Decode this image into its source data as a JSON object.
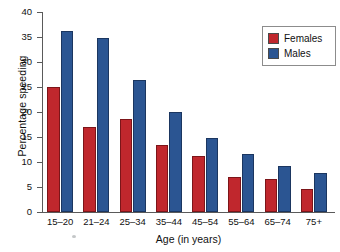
{
  "chart_data": {
    "type": "bar",
    "title": "",
    "xlabel": "Age (in years)",
    "ylabel": "Percentage speeding",
    "categories": [
      "15–20",
      "21–24",
      "25–34",
      "35–44",
      "45–54",
      "55–64",
      "65–74",
      "75+"
    ],
    "series": [
      {
        "name": "Females",
        "color": "#c0272d",
        "values": [
          25.0,
          17.0,
          18.6,
          13.5,
          11.2,
          7.0,
          6.6,
          4.7
        ]
      },
      {
        "name": "Males",
        "color": "#2b5592",
        "values": [
          36.3,
          34.8,
          26.4,
          20.1,
          14.8,
          11.7,
          9.2,
          7.8
        ]
      }
    ],
    "ylim": [
      0,
      40
    ],
    "yticks": [
      0,
      5,
      10,
      15,
      20,
      25,
      30,
      35,
      40
    ],
    "ytick_labels": [
      "0",
      "5",
      "10",
      "15",
      "20",
      "25",
      "30",
      "35",
      "40"
    ],
    "grid": false,
    "legend_position": "top-right"
  },
  "legend": {
    "entries": [
      {
        "label": "Females",
        "color": "#c0272d"
      },
      {
        "label": "Males",
        "color": "#2b5592"
      }
    ]
  },
  "axes": {
    "x_title": "Age (in years)",
    "y_title": "Percentage speeding"
  }
}
